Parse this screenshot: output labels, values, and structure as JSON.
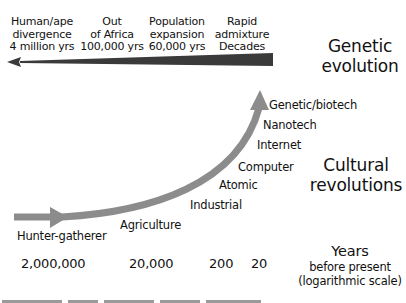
{
  "genetic": {
    "events": [
      {
        "line1": "Human/ape",
        "line2": "divergence",
        "line3": "4 million yrs"
      },
      {
        "line1": "Out",
        "line2": "of Africa",
        "line3": "100,000 yrs"
      },
      {
        "line1": "Population",
        "line2": "expansion",
        "line3": "60,000 yrs"
      },
      {
        "line1": "Rapid",
        "line2": "admixture",
        "line3": "Decades"
      }
    ],
    "label_line1": "Genetic",
    "label_line2": "evolution",
    "arrow_color": "#3a3a3a"
  },
  "cultural": {
    "steps": [
      "Hunter-gatherer",
      "Agriculture",
      "Industrial",
      "Atomic",
      "Computer",
      "Internet",
      "Nanotech",
      "Genetic/biotech"
    ],
    "label_line1": "Cultural",
    "label_line2": "revolutions",
    "arrow_color": "#8c8c8c"
  },
  "time_axis": {
    "ticks": [
      "2,000,000",
      "20,000",
      "200",
      "20"
    ],
    "title_line1": "Years",
    "title_line2": "before present",
    "title_line3": "(logarithmic scale)"
  }
}
